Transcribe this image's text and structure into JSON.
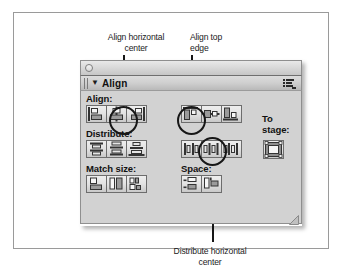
{
  "figure": {
    "type": "annotated-screenshot"
  },
  "callouts": [
    {
      "id": "align-horizontal-center",
      "text": "Align horizontal\ncenter"
    },
    {
      "id": "align-top-edge",
      "text": "Align top\nedge"
    },
    {
      "id": "distribute-horizontal-center",
      "text": "Distribute horizontal\ncenter"
    }
  ],
  "window": {
    "close_button": "close-button",
    "panel": {
      "disclosure_triangle": "▼",
      "title": "Align",
      "options_menu_icon": "panel-options-icon",
      "resize_grip_icon": "resize-grip"
    }
  },
  "panel": {
    "sections": {
      "align": {
        "label": "Align:",
        "left_buttons": [
          {
            "name": "align-left-edge",
            "tooltip": "Align left edge"
          },
          {
            "name": "align-horizontal-center",
            "tooltip": "Align horizontal center"
          },
          {
            "name": "align-right-edge",
            "tooltip": "Align right edge"
          }
        ],
        "right_buttons": [
          {
            "name": "align-top-edge",
            "tooltip": "Align top edge"
          },
          {
            "name": "align-vertical-center",
            "tooltip": "Align vertical center"
          },
          {
            "name": "align-bottom-edge",
            "tooltip": "Align bottom edge"
          }
        ]
      },
      "distribute": {
        "label": "Distribute:",
        "left_buttons": [
          {
            "name": "distribute-top-edge",
            "tooltip": "Distribute top edge"
          },
          {
            "name": "distribute-vertical-center",
            "tooltip": "Distribute vertical center"
          },
          {
            "name": "distribute-bottom-edge",
            "tooltip": "Distribute bottom edge"
          }
        ],
        "right_buttons": [
          {
            "name": "distribute-left-edge",
            "tooltip": "Distribute left edge"
          },
          {
            "name": "distribute-horizontal-center",
            "tooltip": "Distribute horizontal center"
          },
          {
            "name": "distribute-right-edge",
            "tooltip": "Distribute right edge"
          }
        ]
      },
      "match_size": {
        "label": "Match size:",
        "buttons": [
          {
            "name": "match-width",
            "tooltip": "Match width"
          },
          {
            "name": "match-height",
            "tooltip": "Match height"
          },
          {
            "name": "match-width-and-height",
            "tooltip": "Match width and height"
          }
        ]
      },
      "space": {
        "label": "Space:",
        "buttons": [
          {
            "name": "space-evenly-vertically",
            "tooltip": "Space evenly vertically"
          },
          {
            "name": "space-evenly-horizontally",
            "tooltip": "Space evenly horizontally"
          }
        ]
      },
      "to_stage": {
        "label": "To\nstage:",
        "button": {
          "name": "to-stage-toggle",
          "tooltip": "To stage"
        }
      }
    }
  },
  "colors": {
    "page_background": "#ffffff",
    "frame_border": "#9a9a9a",
    "panel_background": "#d2d2d2",
    "panel_header": "#cfcfcf",
    "button_face": "#e2e2e2",
    "button_border": "#6d6d6d",
    "annotation": "#171717",
    "text": "#1b1b1b"
  }
}
